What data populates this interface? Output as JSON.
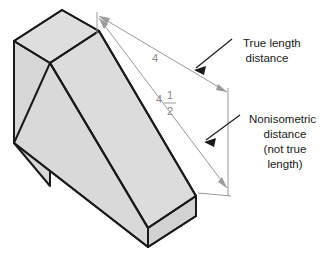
{
  "figure": {
    "background_color": "#ffffff"
  },
  "solid": {
    "name": "wedge-block",
    "face_fill": "#d9d9d9",
    "face_fill_light": "#e0e0e0",
    "face_fill_dark": "#cfcfcf",
    "edge_color": "#1a1a1a",
    "edge_width": "2"
  },
  "dimensions": {
    "line_color": "#9a9a9a",
    "text_color": "#8a8a8a",
    "true_length": {
      "value": "4",
      "label_x": "155",
      "label_y": "62"
    },
    "nonisometric": {
      "whole": "4",
      "numerator": "1",
      "denominator": "2",
      "whole_x": "159",
      "whole_y": "103",
      "numerator_x": "169",
      "numerator_y": "99",
      "denominator_x": "169",
      "denominator_y": "115"
    }
  },
  "callouts": {
    "leader_color": "#1a1a1a",
    "true_length": {
      "name": "true-length-callout",
      "lines": [
        "True length",
        "distance"
      ],
      "x": "243",
      "y": "47",
      "line_height": "15"
    },
    "nonisometric": {
      "name": "nonisometric-callout",
      "lines": [
        "Nonisometric",
        "distance",
        "(not true",
        "length)"
      ],
      "x": "265",
      "y": "123",
      "line_height": "15"
    }
  }
}
